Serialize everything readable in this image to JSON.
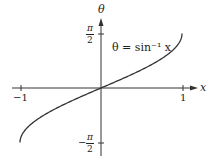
{
  "chart_data": {
    "type": "line",
    "title": "",
    "function_label": "θ = sin⁻¹ x",
    "xlabel": "x",
    "ylabel": "θ",
    "x_ticks": [
      {
        "value": -1,
        "label": "−1"
      },
      {
        "value": 1,
        "label": "1"
      }
    ],
    "y_ticks": [
      {
        "value": 1.5708,
        "label": "π/2"
      },
      {
        "value": -1.5708,
        "label": "−π/2"
      }
    ],
    "xlim": [
      -1,
      1
    ],
    "ylim": [
      -1.5708,
      1.5708
    ],
    "grid": false,
    "series": [
      {
        "name": "arcsin",
        "x": [
          -1,
          -0.9,
          -0.75,
          -0.5,
          -0.25,
          0,
          0.25,
          0.5,
          0.75,
          0.9,
          1
        ],
        "values": [
          -1.5708,
          -1.1198,
          -0.8481,
          -0.5236,
          -0.2527,
          0,
          0.2527,
          0.5236,
          0.8481,
          1.1198,
          1.5708
        ]
      }
    ],
    "colors": {
      "curve": "#333333",
      "axes": "#333333"
    }
  },
  "labels": {
    "x_axis": "x",
    "y_axis": "θ",
    "function": "θ = sin⁻¹ x",
    "x_neg_one": "−1",
    "x_pos_one": "1",
    "pi": "π",
    "two": "2",
    "minus": "−"
  }
}
